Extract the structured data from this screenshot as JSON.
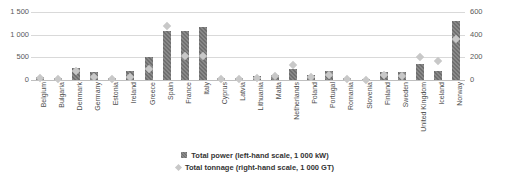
{
  "chart_data": {
    "type": "bar",
    "title": "",
    "subtitle": "",
    "xlabel": "",
    "ylabel": "",
    "grid": true,
    "legend_position": "bottom",
    "categories": [
      "Belgium",
      "Bulgaria",
      "Denmark",
      "Germany",
      "Estonia",
      "Ireland",
      "Greece",
      "Spain",
      "France",
      "Italy",
      "Cyprus",
      "Latvia",
      "Lithuania",
      "Malta",
      "Netherlands",
      "Poland",
      "Portugal",
      "Romania",
      "Slovenia",
      "Finland",
      "Sweden",
      "United Kingdom",
      "Iceland",
      "Norway"
    ],
    "series": [
      {
        "name": "Total power (left-hand scale, 1 000 kW)",
        "axis": "left",
        "unit": "1 000 kW",
        "marker": "bar",
        "color": "#6f6f6f",
        "values": [
          60,
          55,
          265,
          170,
          45,
          195,
          500,
          1075,
          1085,
          1170,
          45,
          35,
          90,
          120,
          235,
          115,
          190,
          55,
          25,
          175,
          180,
          355,
          200,
          1305
        ]
      },
      {
        "name": "Total tonnage (right-hand scale, 1 000 GT)",
        "axis": "right",
        "unit": "1 000 GT",
        "marker": "diamond",
        "color": "#c8c8c8",
        "values": [
          20,
          8,
          80,
          30,
          8,
          28,
          95,
          480,
          215,
          210,
          10,
          5,
          18,
          38,
          130,
          25,
          40,
          8,
          2,
          40,
          35,
          205,
          165,
          365
        ]
      }
    ],
    "left_axis": {
      "ticks": [
        "0",
        "500",
        "1 000",
        "1 500"
      ],
      "values": [
        0,
        500,
        1000,
        1500
      ],
      "ylim": [
        0,
        1500
      ]
    },
    "right_axis": {
      "ticks": [
        "0",
        "200",
        "400",
        "600"
      ],
      "values": [
        0,
        200,
        400,
        600
      ],
      "ylim": [
        0,
        600
      ]
    },
    "legend": [
      {
        "marker": "bar-sw",
        "icon": "square-swatch-icon",
        "label": "Total power (left-hand scale, 1 000 kW)"
      },
      {
        "marker": "dia-sw",
        "icon": "diamond-swatch-icon",
        "label": "Total tonnage (right-hand scale, 1 000 GT)"
      }
    ],
    "colors": {
      "bar": "#6f6f6f",
      "marker": "#c8c8c8",
      "gridline": "#d9d9d9",
      "text": "#4d4d4d"
    }
  }
}
